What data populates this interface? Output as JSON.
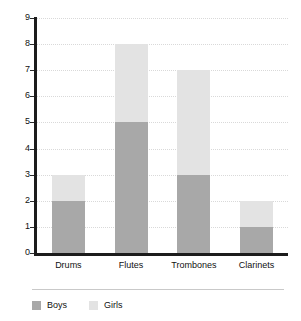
{
  "chart_data": {
    "type": "bar",
    "subtype": "stacked-vertical-bar",
    "title": "",
    "subtitle": "",
    "xlabel": "",
    "ylabel": "",
    "categories": [
      "Drums",
      "Flutes",
      "Trombones",
      "Clarinets"
    ],
    "series": [
      {
        "name": "Boys",
        "color": "#a8a8a8",
        "values": [
          2,
          5,
          3,
          1
        ]
      },
      {
        "name": "Girls",
        "color": "#e3e3e3",
        "values": [
          1,
          3,
          4,
          1
        ]
      }
    ],
    "totals": [
      3,
      8,
      7,
      2
    ],
    "ylim": [
      0,
      9
    ],
    "ytick_labels": [
      "0",
      "1",
      "2",
      "3",
      "4",
      "5",
      "6",
      "7",
      "8",
      "9"
    ],
    "ytick_values": [
      0,
      1,
      2,
      3,
      4,
      5,
      6,
      7,
      8,
      9
    ],
    "grid": true,
    "grid_style": "dotted",
    "grid_color": "#d9d9d9",
    "legend_position": "bottom-left",
    "axis_color": "#1c1c1c",
    "background": "#ffffff"
  },
  "axis": {
    "y_ticks": [
      "9",
      "8",
      "7",
      "6",
      "5",
      "4",
      "3",
      "2",
      "1",
      "0"
    ],
    "x_ticks": [
      "Drums",
      "Flutes",
      "Trombones",
      "Clarinets"
    ]
  },
  "legend": {
    "entries": [
      {
        "label": "Boys",
        "color": "#a8a8a8"
      },
      {
        "label": "Girls",
        "color": "#e3e3e3"
      }
    ]
  }
}
